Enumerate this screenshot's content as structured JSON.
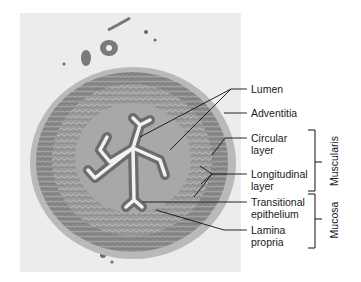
{
  "figure": {
    "labels": [
      {
        "id": "lumen",
        "lines": [
          "Lumen"
        ]
      },
      {
        "id": "adventitia",
        "lines": [
          "Adventitia"
        ]
      },
      {
        "id": "circular",
        "lines": [
          "Circular",
          "layer"
        ]
      },
      {
        "id": "longitudinal",
        "lines": [
          "Longitudinal",
          "layer"
        ]
      },
      {
        "id": "transitional",
        "lines": [
          "Transitional",
          "epithelium"
        ]
      },
      {
        "id": "lamina",
        "lines": [
          "Lamina",
          "propria"
        ]
      }
    ],
    "groups": [
      {
        "id": "muscularis",
        "label": "Muscularis"
      },
      {
        "id": "mucosa",
        "label": "Mucosa"
      }
    ]
  }
}
